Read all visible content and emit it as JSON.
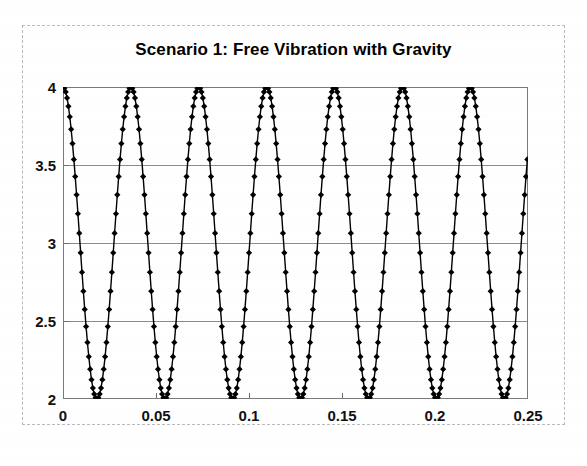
{
  "chart_data": {
    "type": "line",
    "title": "Scenario 1: Free Vibration with Gravity",
    "xlabel": "",
    "ylabel": "",
    "xlim": [
      0,
      0.25
    ],
    "ylim": [
      2,
      4
    ],
    "grid": true,
    "legend": false,
    "marker": "diamond",
    "marker_color": "#000000",
    "line_color": "#000000",
    "xticks": [
      "0",
      "0.05",
      "0.1",
      "0.15",
      "0.2",
      "0.25"
    ],
    "xtick_values": [
      0,
      0.05,
      0.1,
      0.15,
      0.2,
      0.25
    ],
    "yticks": [
      "2",
      "2.5",
      "3",
      "3.5",
      "4"
    ],
    "ytick_values": [
      2,
      2.5,
      3,
      3.5,
      4
    ],
    "series": [
      {
        "name": "displacement",
        "description": "Undamped free vibration: y = 3 + 1*cos(2*pi*t/0.0365), sampled every 0.00073",
        "amplitude": 1,
        "offset": 3,
        "period": 0.0365,
        "sample_step": 0.00073,
        "x": [
          0,
          0.00073,
          0.00146,
          0.00219,
          0.00292,
          0.00365,
          0.00438,
          0.00511,
          0.00584,
          0.00657,
          0.0073,
          0.00803,
          0.00876,
          0.00949,
          0.01022,
          0.01095,
          0.01168,
          0.01241,
          0.01314,
          0.01387,
          0.0146,
          0.01533,
          0.01606,
          0.01679,
          0.01752,
          0.01825,
          0.01898,
          0.01971,
          0.02044,
          0.02117,
          0.0219,
          0.02263,
          0.02336,
          0.02409,
          0.02482,
          0.02555,
          0.02628,
          0.02701,
          0.02774,
          0.02847,
          0.0292,
          0.02993,
          0.03066,
          0.03139,
          0.03212,
          0.03285,
          0.03358,
          0.03431,
          0.03504,
          0.03577,
          0.0365
        ],
        "y": [
          4,
          3.992,
          3.968,
          3.929,
          3.876,
          3.809,
          3.729,
          3.637,
          3.536,
          3.426,
          3.309,
          3.187,
          3.063,
          2.937,
          2.813,
          2.691,
          2.574,
          2.464,
          2.363,
          2.271,
          2.191,
          2.124,
          2.071,
          2.032,
          2.008,
          2,
          2.008,
          2.032,
          2.071,
          2.124,
          2.191,
          2.271,
          2.363,
          2.464,
          2.574,
          2.691,
          2.813,
          2.937,
          3.063,
          3.187,
          3.309,
          3.426,
          3.536,
          3.637,
          3.729,
          3.809,
          3.876,
          3.929,
          3.968,
          3.992,
          4
        ],
        "cycles_visible": 6.85,
        "peaks_x": [
          0,
          0.0365,
          0.073,
          0.1095,
          0.146,
          0.1825,
          0.219
        ],
        "peaks_y": [
          4,
          4,
          4,
          4,
          4,
          4,
          4
        ],
        "minima_x": [
          0.01825,
          0.05475,
          0.09125,
          0.12775,
          0.16425,
          0.20075,
          0.23725
        ],
        "minima_y": [
          2,
          2,
          2,
          2,
          2,
          2,
          2
        ],
        "end_value": 3.72
      }
    ]
  }
}
